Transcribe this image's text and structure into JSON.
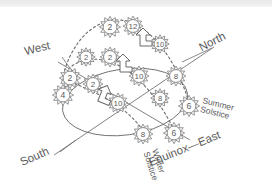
{
  "figure": {
    "stroke_color": "#6b6b6b",
    "text_color": "#5b5b5b",
    "background": "#ffffff",
    "top_band_color": "#ececec"
  },
  "compass_labels": [
    {
      "name": "west",
      "text": "West",
      "x": 38,
      "y": 52,
      "rotate": -14
    },
    {
      "name": "north",
      "text": "North",
      "x": 214,
      "y": 45,
      "rotate": -27
    },
    {
      "name": "south",
      "text": "South",
      "x": 36,
      "y": 160,
      "rotate": -24
    },
    {
      "name": "equinox-east",
      "text": "Equinox—East",
      "x": 186,
      "y": 152,
      "rotate": -22
    }
  ],
  "event_labels": [
    {
      "name": "summer-solstice",
      "line1": "Summer",
      "line2": "Solstice",
      "x": 202,
      "y": 103,
      "rotate": 14
    },
    {
      "name": "winter-solstice",
      "line1": "Winter",
      "line2": "Solstice",
      "x": 152,
      "y": 150,
      "rotate": 72
    }
  ],
  "suns": [
    {
      "label": "2",
      "cx": 110,
      "cy": 27,
      "r": 7.5,
      "arc": "summer"
    },
    {
      "label": "12",
      "cx": 133,
      "cy": 26,
      "r": 7.0,
      "arc": "summer"
    },
    {
      "label": "10",
      "cx": 160,
      "cy": 44,
      "r": 6.5,
      "arc": "summer"
    },
    {
      "label": "8",
      "cx": 176,
      "cy": 76,
      "r": 7.0,
      "arc": "summer"
    },
    {
      "label": "6",
      "cx": 189,
      "cy": 106,
      "r": 7.5,
      "arc": "summer"
    },
    {
      "label": "2",
      "cx": 86,
      "cy": 57,
      "r": 6.5,
      "arc": "equinox"
    },
    {
      "label": "2",
      "cx": 110,
      "cy": 57,
      "r": 7.0,
      "arc": "equinox"
    },
    {
      "label": "10",
      "cx": 139,
      "cy": 76,
      "r": 7.0,
      "arc": "equinox"
    },
    {
      "label": "8",
      "cx": 160,
      "cy": 98,
      "r": 6.5,
      "arc": "equinox"
    },
    {
      "label": "6",
      "cx": 174,
      "cy": 133,
      "r": 7.5,
      "arc": "equinox"
    },
    {
      "label": "2",
      "cx": 70,
      "cy": 78,
      "r": 7.5,
      "arc": "winter"
    },
    {
      "label": "2",
      "cx": 93,
      "cy": 84,
      "r": 7.0,
      "arc": "winter"
    },
    {
      "label": "4",
      "cx": 63,
      "cy": 95,
      "r": 7.5,
      "arc": "winter"
    },
    {
      "label": "10",
      "cx": 118,
      "cy": 103,
      "r": 7.0,
      "arc": "winter"
    },
    {
      "label": "8",
      "cx": 143,
      "cy": 134,
      "r": 7.0,
      "arc": "winter"
    }
  ],
  "arrow_markers": [
    {
      "name": "bent-arrow-1",
      "x": 140,
      "y": 32,
      "rotate": 0
    },
    {
      "name": "bent-arrow-2",
      "x": 120,
      "y": 58,
      "rotate": 0
    },
    {
      "name": "bent-arrow-3",
      "x": 103,
      "y": 88,
      "rotate": 22
    }
  ],
  "horizon": {
    "name": "horizon-ellipse",
    "cx": 125,
    "cy": 102,
    "rx": 63,
    "ry": 33,
    "rotate": -8
  },
  "axes": [
    {
      "name": "north-south-axis",
      "x1": 54,
      "y1": 155,
      "x2": 214,
      "y2": 47
    },
    {
      "name": "east-west-axis",
      "x1": 58,
      "y1": 62,
      "x2": 190,
      "y2": 140
    }
  ],
  "leaders": [
    {
      "name": "west-leader",
      "x1": 62,
      "y1": 57,
      "x2": 74,
      "y2": 74
    },
    {
      "name": "north-leader",
      "x1": 182,
      "y1": 62,
      "x2": 212,
      "y2": 48
    },
    {
      "name": "south-leader",
      "x1": 60,
      "y1": 152,
      "x2": 76,
      "y2": 140
    }
  ],
  "arcs": {
    "summer": "M 62,80 C 70,44 92,20 118,20 C 146,20 176,56 190,106",
    "equinox": "M 72,66 C 86,56 104,58 120,66 C 142,78 162,104 176,134",
    "winter": "M 66,80 C 80,86 96,92 112,102 C 128,112 140,124 146,136"
  }
}
